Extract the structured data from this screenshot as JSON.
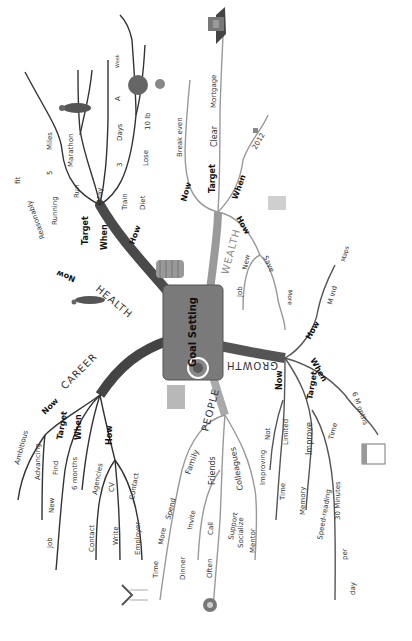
{
  "title": "Goal Setting",
  "center": {
    "label": "Goal Setting",
    "color": "#7a7a7a"
  },
  "branches": {
    "health": {
      "label": "HEALTH",
      "now": {
        "label": "Now",
        "items": [
          "Reasonably",
          "fit"
        ]
      },
      "target": {
        "label": "Target",
        "items": [
          "Running",
          "5",
          "Miles",
          "Run",
          "Marathon"
        ]
      },
      "when": {
        "label": "When",
        "items": [
          "May"
        ]
      },
      "how": {
        "label": "How",
        "items": [
          "Train",
          "3",
          "Days",
          "A",
          "Week",
          "Diet",
          "Lose",
          "10 lb"
        ]
      }
    },
    "wealth": {
      "label": "WEALTH",
      "now": {
        "label": "Now",
        "items": [
          "Break even"
        ]
      },
      "target": {
        "label": "Target",
        "items": [
          "Clear",
          "Mortgage"
        ]
      },
      "when": {
        "label": "When",
        "items": [
          "2012"
        ]
      },
      "how": {
        "label": "How",
        "items": [
          "Job",
          "New",
          "Save",
          "More"
        ]
      }
    },
    "growth": {
      "label": "GROWTH",
      "how": {
        "label": "How",
        "items": [
          "M ind",
          "Maps"
        ]
      },
      "when": {
        "label": "When",
        "items": [
          "6 M onths"
        ]
      },
      "now": {
        "label": "Now",
        "items": [
          "Not",
          "Improving",
          "Limited",
          "Time"
        ]
      },
      "target": {
        "label": "Target",
        "items": [
          "Improve",
          "Memory",
          "Speed-reading",
          "Time",
          "30 Minutes",
          "per",
          "day"
        ]
      }
    },
    "people": {
      "label": "PEOPLE",
      "family": {
        "label": "Family",
        "items": [
          "Spend",
          "More",
          "Time"
        ]
      },
      "friends": {
        "label": "Friends",
        "items": [
          "Invite",
          "Dinner",
          "Call",
          "Often"
        ]
      },
      "colleagues": {
        "label": "Colleagues",
        "items": [
          "Support",
          "Socialize",
          "Mentor"
        ]
      }
    },
    "career": {
      "label": "CAREER",
      "now": {
        "label": "Now",
        "items": [
          "Ambitious",
          "Advancing"
        ]
      },
      "target": {
        "label": "Target",
        "items": [
          "Find",
          "New",
          "Job"
        ]
      },
      "when": {
        "label": "When",
        "items": [
          "6 months"
        ]
      },
      "how": {
        "label": "How",
        "items": [
          "Agencies",
          "Contact",
          "CV",
          "Write",
          "Contact",
          "Employer"
        ]
      }
    }
  },
  "icons": [
    "runner-icon",
    "scale-icon",
    "house-icon",
    "coins-icon",
    "calendar-icon",
    "money-icon",
    "mouse-icon",
    "book-icon",
    "family-icon",
    "office-icon",
    "phone-icon",
    "walker-icon"
  ]
}
